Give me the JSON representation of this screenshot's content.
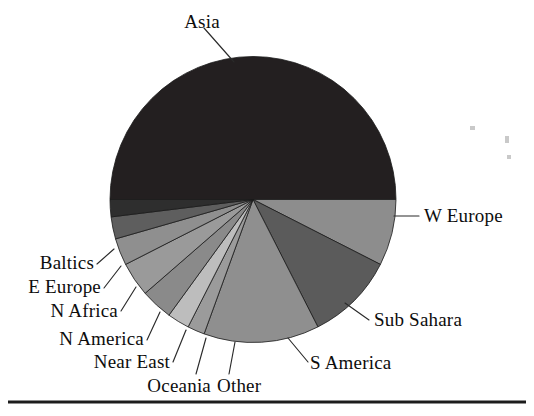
{
  "figure": {
    "name": "world-region-pie-chart",
    "background_color": "#ffffff",
    "rule_color": "#1c1c1c"
  },
  "chart_data": {
    "type": "pie",
    "title": "",
    "subtitle": "",
    "xlabel": "",
    "ylabel": "",
    "legend_position": "none",
    "labels_position": "outside-leader-lines",
    "grid": false,
    "start_angle_deg": 0,
    "direction": "clockwise",
    "total": 100,
    "categories": [
      "Asia",
      "W Europe",
      "Sub Sahara",
      "S America",
      "Other",
      "Oceania",
      "Near East",
      "N America",
      "N Africa",
      "E Europe",
      "Baltics"
    ],
    "values": [
      51.0,
      7.5,
      10.0,
      13.0,
      2.0,
      2.5,
      3.5,
      4.0,
      3.0,
      2.5,
      1.0
    ],
    "colors": [
      "#231f20",
      "#8d8d8d",
      "#5b5b5b",
      "#8f8f8f",
      "#9b9b9b",
      "#bdbdbd",
      "#8a8a8a",
      "#9a9a9a",
      "#8f8f8f",
      "#5e5e5e",
      "#2e2e2e"
    ],
    "slices": [
      {
        "label": "Asia",
        "value": 51.0,
        "color": "#231f20",
        "start_deg": 180.0,
        "end_deg": 0.0
      },
      {
        "label": "W Europe",
        "value": 7.5,
        "color": "#8d8d8d",
        "start_deg": 0.0,
        "end_deg": 27.0
      },
      {
        "label": "Sub Sahara",
        "value": 10.0,
        "color": "#5b5b5b",
        "start_deg": 27.0,
        "end_deg": 63.0
      },
      {
        "label": "S America",
        "value": 13.0,
        "color": "#8f8f8f",
        "start_deg": 63.0,
        "end_deg": 110.0
      },
      {
        "label": "Other",
        "value": 2.0,
        "color": "#9b9b9b",
        "start_deg": 110.0,
        "end_deg": 117.0
      },
      {
        "label": "Oceania",
        "value": 2.5,
        "color": "#bdbdbd",
        "start_deg": 117.0,
        "end_deg": 126.0
      },
      {
        "label": "Near East",
        "value": 3.5,
        "color": "#8a8a8a",
        "start_deg": 126.0,
        "end_deg": 139.0
      },
      {
        "label": "N America",
        "value": 4.0,
        "color": "#9a9a9a",
        "start_deg": 139.0,
        "end_deg": 153.0
      },
      {
        "label": "N Africa",
        "value": 3.0,
        "color": "#8f8f8f",
        "start_deg": 153.0,
        "end_deg": 164.0
      },
      {
        "label": "E Europe",
        "value": 2.5,
        "color": "#5e5e5e",
        "start_deg": 164.0,
        "end_deg": 173.0
      },
      {
        "label": "Baltics",
        "value": 1.0,
        "color": "#2e2e2e",
        "start_deg": 173.0,
        "end_deg": 180.0
      }
    ]
  },
  "labels": {
    "asia": "Asia",
    "w_europe": "W Europe",
    "sub_sahara": "Sub Sahara",
    "s_america": "S America",
    "other": "Other",
    "oceania": "Oceania",
    "near_east": "Near East",
    "n_america": "N America",
    "n_africa": "N Africa",
    "e_europe": "E Europe",
    "baltics": "Baltics"
  }
}
